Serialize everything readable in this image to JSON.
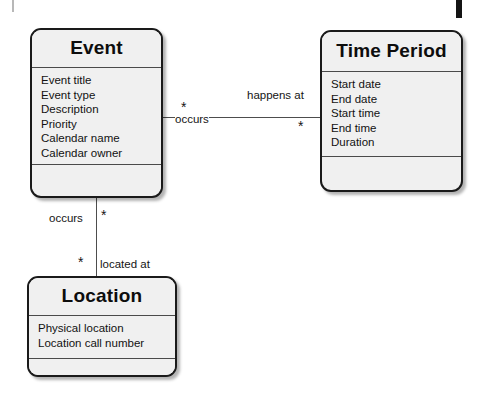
{
  "diagram": {
    "type": "uml-class-diagram",
    "colors": {
      "entity_fill": "#f0f0f0",
      "entity_border": "#1a1a1a",
      "line": "#4d4d4d",
      "text": "#121212",
      "background": "#ffffff"
    }
  },
  "entities": [
    {
      "id": "event",
      "name": "Event",
      "attributes": [
        "Event title",
        "Event type",
        "Description",
        "Priority",
        "Calendar name",
        "Calendar owner"
      ],
      "operations": []
    },
    {
      "id": "time_period",
      "name": "Time Period",
      "attributes": [
        "Start date",
        "End date",
        "Start time",
        "End time",
        "Duration"
      ],
      "operations": []
    },
    {
      "id": "location",
      "name": "Location",
      "attributes": [
        "Physical location",
        "Location call number"
      ],
      "operations": []
    }
  ],
  "associations": [
    {
      "id": "event_time_period",
      "from": "event",
      "to": "time_period",
      "from_role": "occurs",
      "to_role": "happens at",
      "from_multiplicity": "*",
      "to_multiplicity": "*"
    },
    {
      "id": "event_location",
      "from": "event",
      "to": "location",
      "from_role": "occurs",
      "to_role": "located at",
      "from_multiplicity": "*",
      "to_multiplicity": "*"
    }
  ],
  "artifacts": {
    "top_right_mark": "scan-mark",
    "top_left_mark": "scan-mark"
  }
}
